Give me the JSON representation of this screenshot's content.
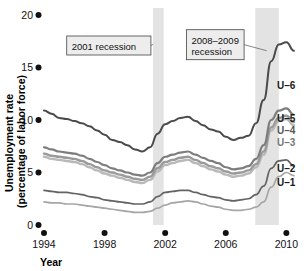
{
  "chart_data": {
    "type": "line",
    "title": "",
    "xlabel": "Year",
    "ylabel": "Unemployment rate (percentage of labor force)",
    "ylabel_line1": "Unemployment rate",
    "ylabel_line2": "(percentage of labor force)",
    "xlim": [
      1994,
      2010.9
    ],
    "ylim": [
      0,
      20
    ],
    "xticks": [
      1994,
      1998,
      2002,
      2006,
      2010
    ],
    "xtick_labels": [
      "1994",
      "1998",
      "2002",
      "2006",
      "2010"
    ],
    "yticks": [
      0,
      5,
      10,
      15,
      20
    ],
    "ytick_labels": [
      "0",
      "5",
      "10",
      "15",
      "20"
    ],
    "grid": false,
    "legend_position": "right-inline",
    "tick_marker_style": "filled-dot",
    "annotations": [
      {
        "id": "recession-2001",
        "label": "2001 recession",
        "box_x": 1995.5,
        "box_y": 18.0,
        "target_x": 2001.2,
        "target_y": 17.2
      },
      {
        "id": "recession-2008-2009",
        "label": "2008–2009 recession",
        "label_line1": "2008–2009",
        "label_line2": "recession",
        "box_x": 2003.4,
        "box_y": 18.6,
        "target_x": 2008.7,
        "target_y": 16.6
      }
    ],
    "shaded_bands": [
      {
        "id": "band-2001",
        "label": "2001 recession",
        "x_start": 2001.2,
        "x_end": 2001.9,
        "color": "#e3e3e3"
      },
      {
        "id": "band-2008-2009",
        "label": "2008-2009 recession",
        "x_start": 2007.95,
        "x_end": 2009.5,
        "color": "#e3e3e3"
      }
    ],
    "x": [
      1994.0,
      1994.5,
      1995.0,
      1995.5,
      1996.0,
      1996.5,
      1997.0,
      1997.5,
      1998.0,
      1998.5,
      1999.0,
      1999.5,
      2000.0,
      2000.5,
      2001.0,
      2001.5,
      2002.0,
      2002.5,
      2003.0,
      2003.5,
      2004.0,
      2004.5,
      2005.0,
      2005.5,
      2006.0,
      2006.5,
      2007.0,
      2007.5,
      2008.0,
      2008.5,
      2009.0,
      2009.5,
      2010.0,
      2010.5
    ],
    "series": [
      {
        "name": "U-6",
        "label": "U–6",
        "color": "#4a4a4a",
        "width": 2.0,
        "values": [
          10.9,
          10.6,
          10.2,
          10.1,
          9.9,
          9.7,
          9.4,
          9.0,
          8.6,
          8.1,
          7.9,
          7.6,
          7.2,
          7.0,
          7.4,
          8.7,
          9.6,
          9.9,
          10.2,
          10.3,
          9.9,
          9.5,
          9.1,
          8.9,
          8.4,
          8.1,
          8.3,
          8.5,
          9.7,
          11.9,
          15.6,
          17.2,
          17.4,
          16.6
        ]
      },
      {
        "name": "U-5",
        "label": "U–5",
        "color": "#7d7d7d",
        "width": 2.2,
        "values": [
          7.4,
          7.2,
          7.0,
          6.9,
          6.8,
          6.6,
          6.3,
          6.0,
          5.7,
          5.4,
          5.2,
          5.0,
          4.8,
          4.7,
          5.0,
          5.9,
          6.5,
          6.7,
          6.9,
          7.0,
          6.7,
          6.4,
          6.1,
          5.9,
          5.5,
          5.3,
          5.4,
          5.6,
          6.3,
          7.6,
          10.0,
          10.9,
          11.1,
          10.5
        ]
      },
      {
        "name": "U-4",
        "label": "U–4",
        "color": "#9a9a9a",
        "width": 2.4,
        "values": [
          6.8,
          6.6,
          6.5,
          6.4,
          6.3,
          6.1,
          5.8,
          5.5,
          5.2,
          5.0,
          4.8,
          4.6,
          4.4,
          4.3,
          4.6,
          5.4,
          6.0,
          6.2,
          6.4,
          6.5,
          6.2,
          5.9,
          5.6,
          5.4,
          5.1,
          4.9,
          5.0,
          5.2,
          5.8,
          7.0,
          9.3,
          10.2,
          10.4,
          9.8
        ]
      },
      {
        "name": "U-3",
        "label": "U–3",
        "color": "#b9b9b9",
        "width": 2.4,
        "values": [
          6.5,
          6.3,
          6.2,
          6.1,
          6.0,
          5.8,
          5.5,
          5.2,
          4.9,
          4.7,
          4.5,
          4.3,
          4.1,
          4.0,
          4.3,
          5.1,
          5.7,
          5.9,
          6.1,
          6.2,
          5.9,
          5.6,
          5.3,
          5.1,
          4.8,
          4.6,
          4.7,
          4.9,
          5.5,
          6.7,
          9.0,
          9.9,
          10.1,
          9.5
        ]
      },
      {
        "name": "U-2",
        "label": "U–2",
        "color": "#636363",
        "width": 1.7,
        "values": [
          3.3,
          3.2,
          3.1,
          3.1,
          3.0,
          2.9,
          2.7,
          2.6,
          2.4,
          2.3,
          2.2,
          2.1,
          2.0,
          2.0,
          2.2,
          2.7,
          3.1,
          3.2,
          3.3,
          3.3,
          3.1,
          2.9,
          2.7,
          2.6,
          2.4,
          2.3,
          2.4,
          2.5,
          2.9,
          3.7,
          5.4,
          6.1,
          6.2,
          5.6
        ]
      },
      {
        "name": "U-1",
        "label": "U–1",
        "color": "#a6a6a6",
        "width": 1.7,
        "values": [
          2.2,
          2.1,
          2.1,
          2.0,
          2.0,
          1.9,
          1.8,
          1.7,
          1.6,
          1.5,
          1.4,
          1.3,
          1.2,
          1.2,
          1.3,
          1.6,
          1.9,
          2.1,
          2.2,
          2.3,
          2.2,
          2.0,
          1.8,
          1.7,
          1.5,
          1.4,
          1.4,
          1.5,
          1.7,
          2.2,
          3.6,
          4.6,
          5.0,
          4.7
        ]
      }
    ]
  }
}
